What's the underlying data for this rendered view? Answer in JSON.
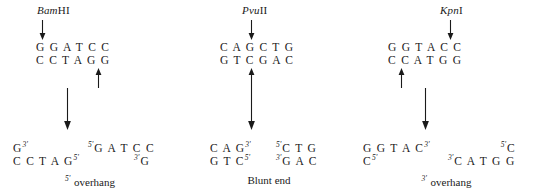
{
  "figure": {
    "background_color": "#ffffff",
    "text_color": "#1a1a1a"
  },
  "panels": [
    {
      "id": "bamhi",
      "enzyme": {
        "italic_part": "Bam",
        "roman_part": "HI",
        "full": "BamHI"
      },
      "cut_arrow_top": {
        "name": "top-strand-cut-arrow",
        "direction": "down"
      },
      "cut_arrow_bottom": {
        "name": "bottom-strand-cut-arrow",
        "direction": "up"
      },
      "reaction_arrow": {
        "name": "cleavage-reaction-arrow",
        "direction": "down"
      },
      "recognition_site": {
        "top_strand": "G G A T C C",
        "bottom_strand": "C C T A G G"
      },
      "products": {
        "left_fragment": {
          "top_strand": "G",
          "top_prime": "3'",
          "bottom_strand": "C C T A G",
          "bottom_prime": "5'"
        },
        "right_fragment": {
          "top_prime": "5'",
          "top_strand": "G A T C C",
          "bottom_prime": "3'",
          "bottom_strand": "G"
        }
      },
      "caption": {
        "prime": "5'",
        "text": " overhang",
        "full": "5' overhang"
      }
    },
    {
      "id": "pvuii",
      "enzyme": {
        "italic_part": "Pvu",
        "roman_part": "II",
        "full": "PvuII"
      },
      "cut_arrow_top": {
        "name": "top-strand-cut-arrow",
        "direction": "down"
      },
      "cut_arrow_bottom": {
        "name": "bottom-strand-cut-arrow",
        "direction": "up"
      },
      "reaction_arrow": {
        "name": "cleavage-reaction-arrow",
        "direction": "down"
      },
      "recognition_site": {
        "top_strand": "C A G C T G",
        "bottom_strand": "G T C G A C"
      },
      "products": {
        "left_fragment": {
          "top_strand": "C A G",
          "top_prime": "3'",
          "bottom_strand": "G T C",
          "bottom_prime": "5'"
        },
        "right_fragment": {
          "top_prime": "5'",
          "top_strand": "C T G",
          "bottom_prime": "3'",
          "bottom_strand": "G A C"
        }
      },
      "caption": {
        "prime": "",
        "text": "Blunt end",
        "full": "Blunt end"
      }
    },
    {
      "id": "kpni",
      "enzyme": {
        "italic_part": "Kpn",
        "roman_part": "I",
        "full": "KpnI"
      },
      "cut_arrow_top": {
        "name": "top-strand-cut-arrow",
        "direction": "down"
      },
      "cut_arrow_bottom": {
        "name": "bottom-strand-cut-arrow",
        "direction": "up"
      },
      "reaction_arrow": {
        "name": "cleavage-reaction-arrow",
        "direction": "down"
      },
      "recognition_site": {
        "top_strand": "G G T A C C",
        "bottom_strand": "C C A T G G"
      },
      "products": {
        "left_fragment": {
          "top_strand": "G G T A C",
          "top_prime": "3'",
          "bottom_strand": "C",
          "bottom_prime": "5'"
        },
        "right_fragment": {
          "top_prime": "5'",
          "top_strand": "C",
          "bottom_prime": "3'",
          "bottom_strand": "C A T G G"
        }
      },
      "caption": {
        "prime": "3'",
        "text": " overhang",
        "full": "3' overhang"
      }
    }
  ]
}
